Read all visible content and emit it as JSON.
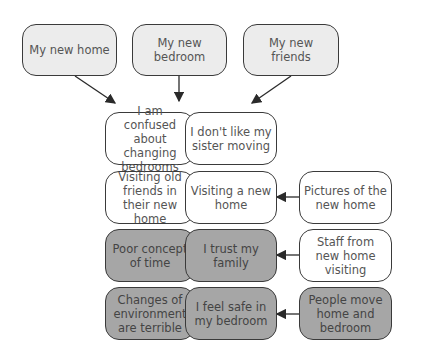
{
  "diagram": {
    "top_nodes": [
      {
        "id": "n1",
        "label": "My new home",
        "style": "light"
      },
      {
        "id": "n2",
        "label": "My new bedroom",
        "style": "light"
      },
      {
        "id": "n3",
        "label": "My new friends",
        "style": "light"
      }
    ],
    "left_column": [
      {
        "id": "l1",
        "label": "I am confused about changing bedrooms",
        "style": "white"
      },
      {
        "id": "l2",
        "label": "Visiting old friends in their new home",
        "style": "white"
      },
      {
        "id": "l3",
        "label": "Poor concept of time",
        "style": "dark"
      },
      {
        "id": "l4",
        "label": "Changes of environment are terrible",
        "style": "dark"
      }
    ],
    "middle_column": [
      {
        "id": "m1",
        "label": "I don't like my sister moving",
        "style": "white"
      },
      {
        "id": "m2",
        "label": "Visiting a new home",
        "style": "white"
      },
      {
        "id": "m3",
        "label": "I trust my family",
        "style": "dark"
      },
      {
        "id": "m4",
        "label": "I feel safe in my bedroom",
        "style": "dark"
      }
    ],
    "right_column": [
      {
        "id": "r2",
        "label": "Pictures of the new home",
        "style": "white"
      },
      {
        "id": "r3",
        "label": "Staff from new home visiting",
        "style": "white"
      },
      {
        "id": "r4",
        "label": "People move home and bedroom",
        "style": "dark"
      }
    ],
    "edges": [
      {
        "from": "n1",
        "to": "grid"
      },
      {
        "from": "n2",
        "to": "grid"
      },
      {
        "from": "n3",
        "to": "grid"
      },
      {
        "from": "r2",
        "to": "m2"
      },
      {
        "from": "r3",
        "to": "m3"
      },
      {
        "from": "r4",
        "to": "m4"
      }
    ],
    "colors": {
      "light": "#ececec",
      "white": "#ffffff",
      "dark": "#a6a6a6",
      "border": "#3a3a3a"
    }
  }
}
